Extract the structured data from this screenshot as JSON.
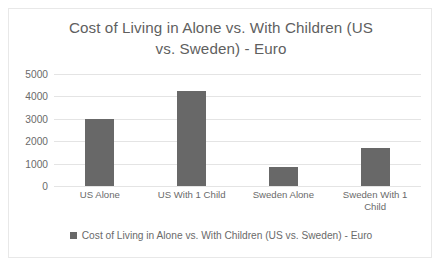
{
  "chart_data": {
    "type": "bar",
    "title": "Cost of Living in Alone vs. With Children (US\nvs. Sweden) - Euro",
    "title_line1": "Cost of Living in Alone vs. With Children (US",
    "title_line2": "vs. Sweden) - Euro",
    "categories": [
      "US Alone",
      "US With 1 Child",
      "Sweden Alone",
      "Sweden With 1 Child"
    ],
    "values": [
      3000,
      4250,
      850,
      1700
    ],
    "series": [
      {
        "name": "Cost of Living in Alone vs. With Children (US vs. Sweden) - Euro",
        "values": [
          3000,
          4250,
          850,
          1700
        ]
      }
    ],
    "xlabel": "",
    "ylabel": "",
    "ylim": [
      0,
      5000
    ],
    "yticks": [
      5000,
      4000,
      3000,
      2000,
      1000,
      0
    ],
    "ytick_labels": [
      "5000",
      "4000",
      "3000",
      "2000",
      "1000",
      "0"
    ],
    "grid": true,
    "legend_position": "bottom",
    "legend_entries": [
      "Cost of Living in Alone vs. With Children (US vs. Sweden) - Euro"
    ],
    "colors": {
      "bar": "#686868",
      "gridline": "#e4e4e4",
      "text": "#6a6a6a",
      "title_text": "#5f5f5f",
      "frame_border": "#e8e8e8",
      "background": "#ffffff"
    }
  }
}
